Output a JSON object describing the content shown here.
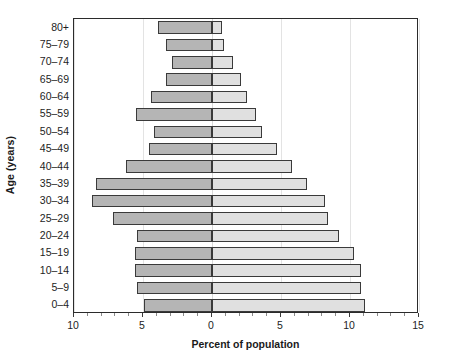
{
  "chart_data": {
    "type": "bar",
    "subtype": "population-pyramid",
    "title": "",
    "xlabel": "Percent of population",
    "ylabel": "Age (years)",
    "orientation": "horizontal",
    "grid": true,
    "legend": "none",
    "x_axis": {
      "ticks": [
        -10,
        -5,
        0,
        5,
        10,
        15
      ],
      "tick_labels": [
        "10",
        "5",
        "0",
        "5",
        "10",
        "15"
      ],
      "minor_tick_step": 1,
      "xlim": [
        -10,
        15
      ],
      "note": "Left side plotted as negative values, labeled as positive magnitudes"
    },
    "categories": [
      "0–4",
      "5–9",
      "10–14",
      "15–19",
      "20–24",
      "25–29",
      "30–34",
      "35–39",
      "40–44",
      "45–49",
      "50–54",
      "55–59",
      "60–64",
      "65–69",
      "70–74",
      "75–79",
      "80+"
    ],
    "series": [
      {
        "name": "left",
        "side": "left",
        "color": "#b5b5b5",
        "values": [
          4.9,
          5.4,
          5.6,
          5.6,
          5.4,
          7.2,
          8.7,
          8.4,
          6.2,
          4.6,
          4.2,
          5.5,
          4.4,
          3.3,
          2.9,
          3.3,
          3.9
        ]
      },
      {
        "name": "right",
        "side": "right",
        "color": "#e0e0e0",
        "values": [
          11.1,
          10.8,
          10.8,
          10.3,
          9.2,
          8.4,
          8.2,
          6.9,
          5.8,
          4.7,
          3.6,
          3.2,
          2.5,
          2.1,
          1.5,
          0.85,
          0.7
        ]
      }
    ]
  },
  "axis_titles": {
    "x": "Percent of population",
    "y": "Age (years)"
  }
}
